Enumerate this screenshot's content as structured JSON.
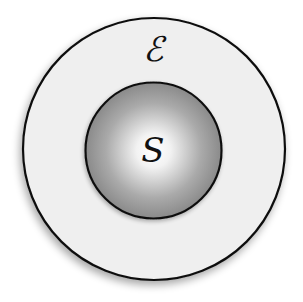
{
  "diagram": {
    "type": "nested-sets",
    "outer": {
      "label": "ℰ",
      "meaning": "environment",
      "fill": "#efefef",
      "stroke": "#111111",
      "cx": 154,
      "cy": 149,
      "r": 131
    },
    "inner": {
      "label": "S",
      "meaning": "system",
      "gradient_center": "#ffffff",
      "gradient_edge": "#8a8a8a",
      "stroke": "#111111",
      "cx": 153.5,
      "cy": 150.5,
      "r": 68
    }
  }
}
